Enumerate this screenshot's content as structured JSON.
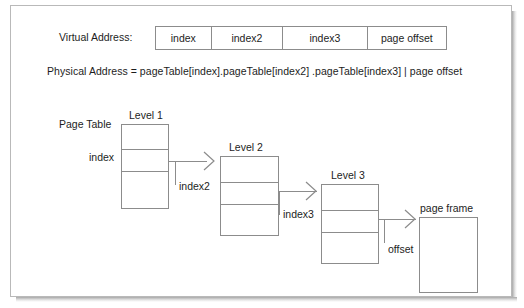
{
  "diagram": {
    "title_absent": true,
    "virtual_address": {
      "label": "Virtual Address:",
      "fields": [
        {
          "name": "index",
          "label": "index"
        },
        {
          "name": "index2",
          "label": "index2"
        },
        {
          "name": "index3",
          "label": "index3"
        },
        {
          "name": "page_offset",
          "label": "page offset"
        }
      ]
    },
    "physical_address": {
      "formula": "Physical Address = pageTable[index].pageTable[index2] .pageTable[index3] | page offset"
    },
    "page_table_label": "Page Table",
    "levels": [
      {
        "caption": "Level 1",
        "entry_label": "index",
        "out_label": "index2",
        "rows": 3
      },
      {
        "caption": "Level 2",
        "entry_label": "index2",
        "out_label": "index3",
        "rows": 3
      },
      {
        "caption": "Level 3",
        "entry_label": "index3",
        "out_label": "offset",
        "rows": 3
      }
    ],
    "page_frame": {
      "caption": "page frame",
      "in_label": "offset"
    },
    "colors": {
      "stroke": "#8c8c8c",
      "text": "#1d1d1d",
      "panel_border": "#b9b9b9",
      "background": "#ffffff"
    }
  }
}
